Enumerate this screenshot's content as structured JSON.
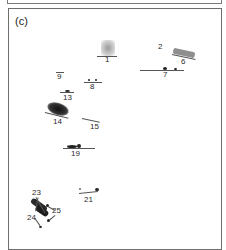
{
  "figure": {
    "panel_label": "(c)",
    "spots": [
      {
        "id": "1",
        "label": "1"
      },
      {
        "id": "2",
        "label": "2"
      },
      {
        "id": "6",
        "label": "6"
      },
      {
        "id": "7",
        "label": "7"
      },
      {
        "id": "8",
        "label": "8"
      },
      {
        "id": "9",
        "label": "9"
      },
      {
        "id": "13",
        "label": "13"
      },
      {
        "id": "14",
        "label": "14"
      },
      {
        "id": "15",
        "label": "15"
      },
      {
        "id": "19",
        "label": "19"
      },
      {
        "id": "21",
        "label": "21"
      },
      {
        "id": "23",
        "label": "23"
      },
      {
        "id": "24",
        "label": "24"
      },
      {
        "id": "25",
        "label": "25"
      }
    ]
  }
}
